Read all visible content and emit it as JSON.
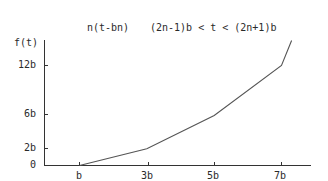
{
  "chart_data": {
    "type": "line",
    "title": "n(t-bn)      (2n-1)b < t < (2n+1)b",
    "title_parts": [
      "n(t-bn)",
      "(2n-1)b < t < (2n+1)b"
    ],
    "ylabel": "f(t)",
    "xlabel": "",
    "x_tick_labels": [
      "b",
      "3b",
      "5b",
      "7b"
    ],
    "x_tick_values": [
      1,
      3,
      5,
      7
    ],
    "y_tick_labels": [
      "0",
      "2b",
      "6b",
      "12b"
    ],
    "y_tick_values": [
      0,
      2,
      6,
      12
    ],
    "unit": "b",
    "series": [
      {
        "name": "f(t)",
        "x": [
          1,
          3,
          5,
          7,
          7.3
        ],
        "y": [
          0,
          2,
          6,
          12,
          15
        ]
      }
    ],
    "xlim": [
      0,
      8.5
    ],
    "ylim": [
      0,
      15.5
    ],
    "grid": false,
    "legend": "none",
    "line_color": "#555555"
  }
}
